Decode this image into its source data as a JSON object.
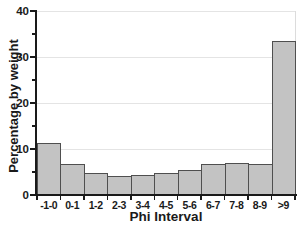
{
  "chart_data": {
    "type": "bar",
    "title": "",
    "xlabel": "Phi Interval",
    "ylabel": "Percentage by weight",
    "categories": [
      "-1-0",
      "0-1",
      "1-2",
      "2-3",
      "3-4",
      "4-5",
      "5-6",
      "6-7",
      "7-8",
      "8-9",
      ">9"
    ],
    "values": [
      11.2,
      6.8,
      4.7,
      4.2,
      4.4,
      4.7,
      5.5,
      6.8,
      7.0,
      6.8,
      33.5
    ],
    "ylim": [
      0,
      40
    ],
    "yticks_major": [
      0,
      10,
      20,
      30,
      40
    ],
    "yticks_minor": [
      5,
      15,
      25,
      35
    ],
    "grid": "horizontal-light",
    "legend": "none",
    "colors": {
      "bar_fill": "#c3c3c3",
      "bar_border": "#4f4f4f",
      "axis": "#1a1a1a",
      "grid": "#e4e4e4",
      "background": "#ffffff"
    }
  }
}
